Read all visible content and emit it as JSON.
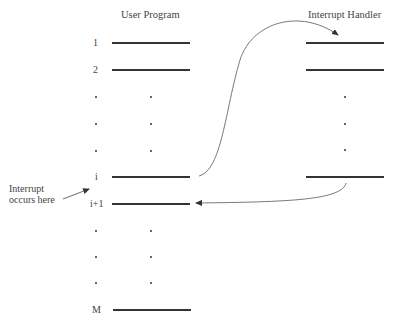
{
  "user_program": {
    "title": "User Program",
    "rows": [
      {
        "label": "1",
        "type": "line",
        "y": 43
      },
      {
        "label": "2",
        "type": "line",
        "y": 70
      },
      {
        "label": "•",
        "type": "dots",
        "y": 97
      },
      {
        "label": "•",
        "type": "dots",
        "y": 124
      },
      {
        "label": "•",
        "type": "dots",
        "y": 151
      },
      {
        "label": "i",
        "type": "line",
        "y": 177
      },
      {
        "label": "i+1",
        "type": "line",
        "y": 204
      },
      {
        "label": "•",
        "type": "dots",
        "y": 231
      },
      {
        "label": "•",
        "type": "dots",
        "y": 257
      },
      {
        "label": "•",
        "type": "dots",
        "y": 284
      },
      {
        "label": "M",
        "type": "line",
        "y": 310
      }
    ]
  },
  "interrupt_handler": {
    "title": "Interrupt Handler",
    "rows": [
      {
        "type": "line",
        "y": 43
      },
      {
        "type": "line",
        "y": 70
      },
      {
        "type": "dot",
        "y": 97
      },
      {
        "type": "dot",
        "y": 124
      },
      {
        "type": "dot",
        "y": 151
      },
      {
        "type": "line",
        "y": 177
      }
    ]
  },
  "annotation": {
    "line1": "Interrupt",
    "line2": "occurs here"
  },
  "colors": {
    "line": "#333333",
    "text": "#444444",
    "background": "#ffffff"
  }
}
